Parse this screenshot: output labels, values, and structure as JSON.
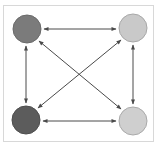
{
  "diagram": {
    "type": "fully-connected-graph",
    "nodes": [
      {
        "id": "top-left",
        "cx": 27,
        "cy": 29,
        "r": 14,
        "fill": "#7b7b7b",
        "stroke": "#6a6a6a"
      },
      {
        "id": "top-right",
        "cx": 133,
        "cy": 28,
        "r": 14,
        "fill": "#c9c9c9",
        "stroke": "#a8a8a8"
      },
      {
        "id": "bottom-left",
        "cx": 26,
        "cy": 120,
        "r": 14,
        "fill": "#5c5c5c",
        "stroke": "#4e4e4e"
      },
      {
        "id": "bottom-right",
        "cx": 133,
        "cy": 121,
        "r": 14,
        "fill": "#cfcfcf",
        "stroke": "#aaaaaa"
      }
    ],
    "edges": [
      {
        "from": "top-left",
        "to": "top-right",
        "direction": "bidirectional"
      },
      {
        "from": "top-left",
        "to": "bottom-left",
        "direction": "bidirectional"
      },
      {
        "from": "top-right",
        "to": "bottom-right",
        "direction": "bidirectional"
      },
      {
        "from": "bottom-left",
        "to": "bottom-right",
        "direction": "bidirectional"
      },
      {
        "from": "top-left",
        "to": "bottom-right",
        "direction": "bidirectional"
      },
      {
        "from": "top-right",
        "to": "bottom-left",
        "direction": "bidirectional"
      }
    ],
    "colors": {
      "edge": "#4a4a4a",
      "frame": "#d8d8d8"
    }
  }
}
